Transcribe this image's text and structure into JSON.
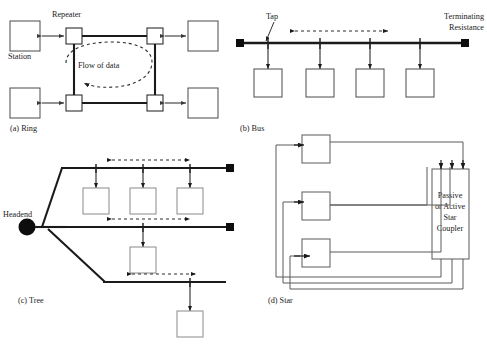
{
  "figure": {
    "title_visible": false,
    "background_color": "#ffffff",
    "line_color": "#1a1a1a",
    "node_fill": "#ffffff"
  },
  "ring": {
    "caption": "(a) Ring",
    "station_label": "Station",
    "repeater_label": "Repeater",
    "flow_label": "Flow of data",
    "station_count": 4,
    "repeater_count": 4,
    "flow_direction": "counterclockwise"
  },
  "bus": {
    "caption": "(b) Bus",
    "tap_label": "Tap",
    "terminating_label_line1": "Terminating",
    "terminating_label_line2": "Resistance",
    "station_count": 4,
    "tap_count": 4,
    "terminator_count": 2,
    "flow_direction": "bidirectional"
  },
  "tree": {
    "caption": "(c) Tree",
    "headend_label": "Headend",
    "branch_count": 3,
    "branch_station_counts": [
      3,
      1,
      1
    ],
    "terminator_count": 2,
    "flow_direction": "bidirectional"
  },
  "star": {
    "caption": "(d)   Star",
    "coupler_lines": [
      "Passive",
      "or Active",
      "Star",
      "Coupler"
    ],
    "station_count": 3,
    "link_count": 3
  }
}
